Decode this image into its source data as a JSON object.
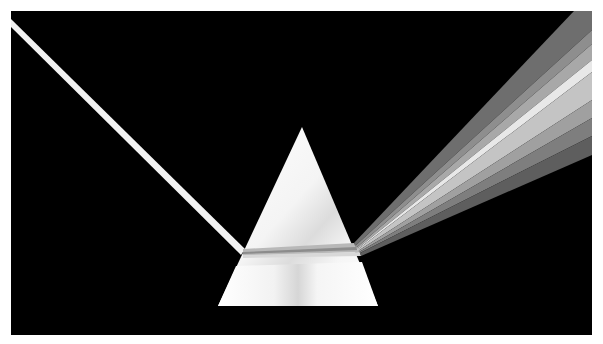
{
  "image": {
    "description": "Prism dispersing a beam of white light into a spectrum on a black background (grayscale)",
    "colors": {
      "page_background": "#ffffff",
      "frame_background": "#000000",
      "prism_fill": "#f7f7f7",
      "incoming_beam": "#f2f2f2",
      "spectrum_bands": [
        "#8a8a8a",
        "#a6a6a6",
        "#e6e6e6",
        "#c2c2c2",
        "#9c9c9c",
        "#7a7a7a"
      ]
    },
    "elements": {
      "frame": "black-frame",
      "prism": "triangular-prism",
      "incoming_beam": "incoming-light-beam",
      "internal_beam": "refracted-beam-inside-prism",
      "spectrum": "dispersed-spectrum-fan"
    }
  }
}
